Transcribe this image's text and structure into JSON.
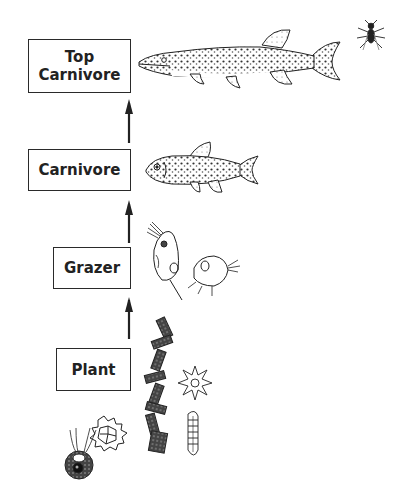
{
  "levels": [
    {
      "id": "top-carnivore",
      "label": "Top\nCarnivore",
      "organisms": [
        "pike-fish",
        "fly"
      ]
    },
    {
      "id": "carnivore",
      "label": "Carnivore",
      "organisms": [
        "minnow-fish"
      ]
    },
    {
      "id": "grazer",
      "label": "Grazer",
      "organisms": [
        "daphnia",
        "copepod"
      ]
    },
    {
      "id": "plant",
      "label": "Plant",
      "organisms": [
        "filamentous-algae",
        "star-algae",
        "pediastrum-algae",
        "flagellate-algae",
        "diatom"
      ]
    }
  ],
  "arrows": [
    {
      "from": "plant",
      "to": "grazer"
    },
    {
      "from": "grazer",
      "to": "carnivore"
    },
    {
      "from": "carnivore",
      "to": "top-carnivore"
    }
  ],
  "colors": {
    "ink": "#222222",
    "box_border": "#2a2a2a",
    "background": "#ffffff"
  }
}
